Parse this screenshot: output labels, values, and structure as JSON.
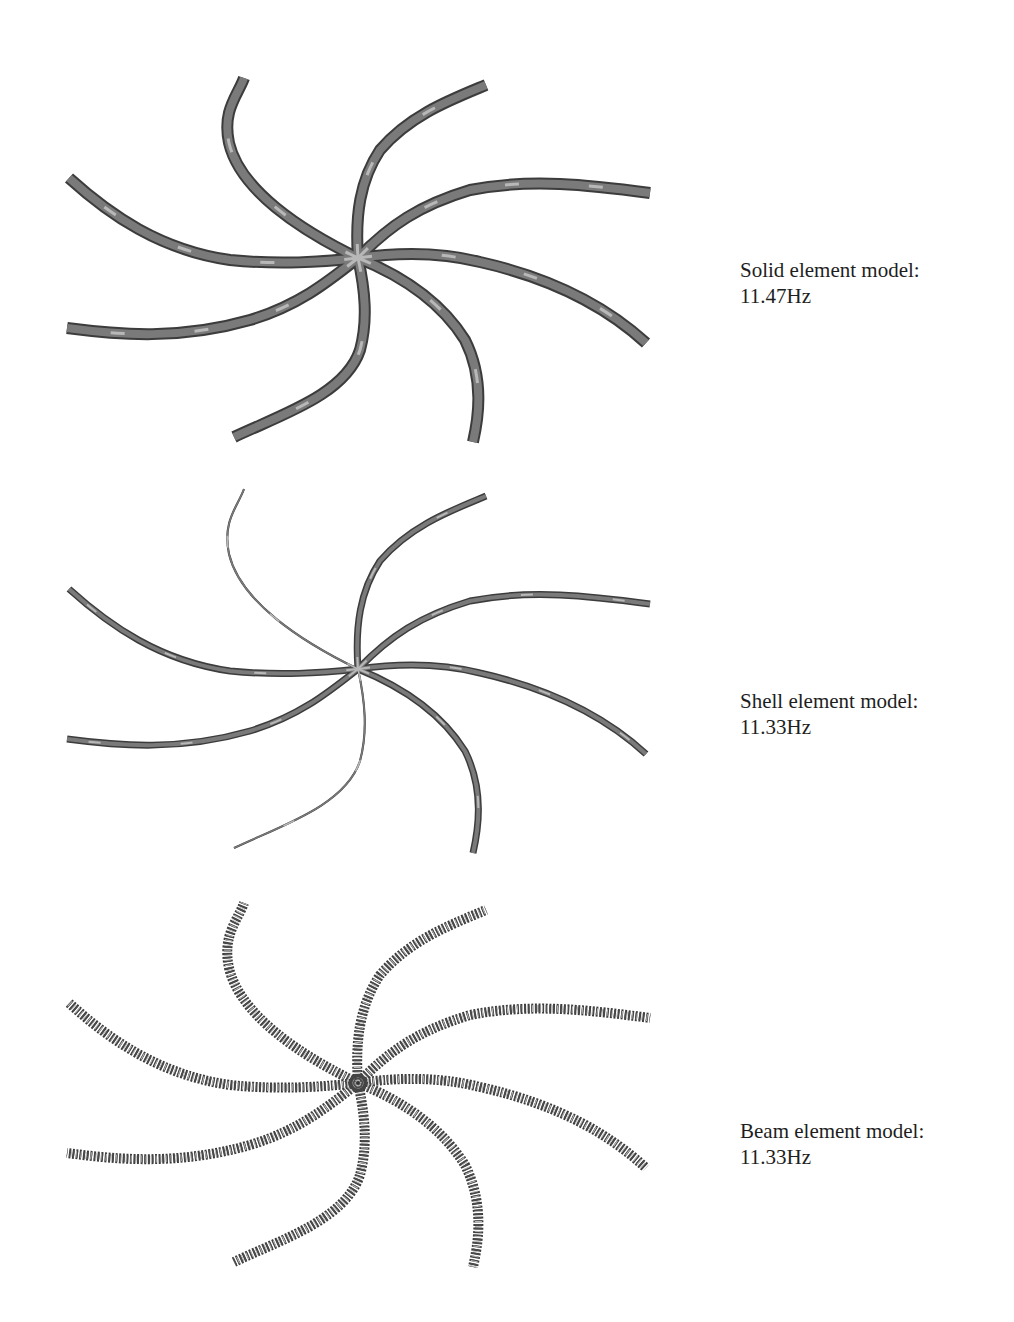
{
  "figures": [
    {
      "id": "solid",
      "caption_line1": "Solid element model:",
      "caption_line2": "11.47Hz",
      "model_type": "Solid element model",
      "frequency": "11.47Hz",
      "offset_y": 0,
      "render_style": "solid-bar"
    },
    {
      "id": "shell",
      "caption_line1": "Shell element model:",
      "caption_line2": "11.33Hz",
      "model_type": "Shell element model",
      "frequency": "11.33Hz",
      "offset_y": 411,
      "render_style": "thin-ribbon"
    },
    {
      "id": "beam",
      "caption_line1": "Beam element model:",
      "caption_line2": "11.33Hz",
      "model_type": "Beam element model",
      "frequency": "11.33Hz",
      "offset_y": 825,
      "render_style": "segmented-beam"
    }
  ],
  "geometry": {
    "arm_count": 8,
    "center": [
      358,
      258
    ],
    "arms": [
      "M358,258 C300,230 240,190 229,143 C222,110 238,95 244,78",
      "M358,258 C355,215 360,180 380,150 C410,115 450,100 486,85",
      "M358,258 C390,225 420,205 470,190 C530,178 590,185 650,193",
      "M358,258 C400,252 440,252 480,262 C560,280 610,310 646,343",
      "M358,258 C400,275 440,300 465,340 C485,380 478,420 473,442",
      "M358,258 C365,290 368,320 360,350 C345,395 280,415 234,437",
      "M358,258 C330,280 300,305 250,320 C180,340 120,335 67,328",
      "M358,258 C320,262 280,265 230,260 C160,250 110,215 69,178"
    ]
  },
  "colors": {
    "background": "#ffffff",
    "arm_dark": "#4a4a4a",
    "arm_mid": "#7a7a7a",
    "arm_light": "#b8b8b8",
    "caption_text": "#1e1e1e"
  }
}
